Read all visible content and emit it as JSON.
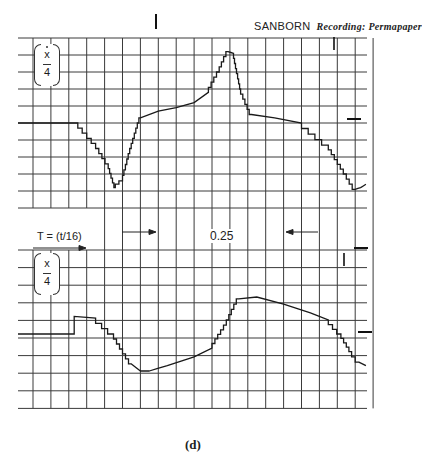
{
  "header": {
    "brand": "SANBORN",
    "paper": "Recording: Permapaper"
  },
  "labels": {
    "top_ylabel": {
      "numerator": "x",
      "denominator": "4",
      "dot": true
    },
    "bottom_ylabel": {
      "numerator": "x",
      "denominator": "4",
      "dot": false
    },
    "time_scale": "T = (t/16)",
    "interval": "0.25",
    "caption": "(d)"
  },
  "colors": {
    "paper": "#ffffff",
    "grid": "#3a3a3a",
    "trace": "#1a1a1a"
  },
  "chart_data": [
    {
      "type": "line",
      "title": "Top trace: normalized velocity",
      "ylabel": "(x-dot / 4)",
      "xlabel": "T = (t/16)",
      "grid": true,
      "legend_position": "none",
      "x_divisions": 19,
      "y_divisions": 10,
      "annotations": [
        "SANBORN Recording: Permapaper",
        "0.25 interval marked by inward arrows"
      ],
      "x": [
        0,
        2.5,
        3.5,
        4.2,
        4.6,
        5.0,
        5.4,
        6.0,
        7.0,
        8.0,
        9.0,
        9.8,
        10.4,
        10.9,
        11.2,
        11.6,
        12.2,
        13.5,
        15.0,
        16.5,
        17.5,
        18.0,
        18.3,
        18.6
      ],
      "values": [
        0,
        0,
        -1.2,
        -2.4,
        -3.8,
        -3.4,
        -1.8,
        0.3,
        0.7,
        0.9,
        1.2,
        1.8,
        3.0,
        4.2,
        4.1,
        2.0,
        0.5,
        0.3,
        0.0,
        -1.3,
        -3.0,
        -3.9,
        -3.8,
        -3.6
      ],
      "ylim": [
        -5,
        5
      ]
    },
    {
      "type": "line",
      "title": "Bottom trace: normalized displacement",
      "ylabel": "(x / 4)",
      "xlabel": "T = (t/16)",
      "grid": true,
      "legend_position": "none",
      "x_divisions": 19,
      "y_divisions": 9,
      "x": [
        0,
        2.3,
        2.3,
        3.5,
        4.5,
        5.5,
        6.0,
        6.5,
        7.5,
        9.0,
        10.0,
        10.8,
        11.5,
        12.5,
        14.0,
        15.5,
        16.5,
        17.2,
        17.8,
        18.2,
        18.6
      ],
      "values": [
        0,
        0,
        1.0,
        0.9,
        0.0,
        -1.7,
        -2.1,
        -2.1,
        -1.8,
        -1.3,
        -0.8,
        0.5,
        2.0,
        2.1,
        1.7,
        1.2,
        0.8,
        0.0,
        -1.0,
        -1.6,
        -1.8
      ],
      "ylim": [
        -4,
        5
      ]
    }
  ]
}
